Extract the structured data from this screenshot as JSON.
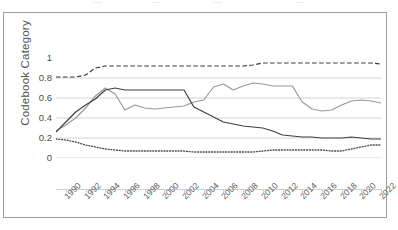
{
  "chart_data": {
    "type": "line",
    "title": "",
    "xlabel": "",
    "ylabel": "Codebook Category",
    "xlim": [
      1989,
      2022
    ],
    "ylim": [
      0,
      1
    ],
    "ytick_labels": [
      "1",
      "0.8",
      "0.6",
      "0.4",
      "0.2",
      "0"
    ],
    "ytick_values": [
      1,
      0.8,
      0.6,
      0.4,
      0.2,
      0
    ],
    "xtick_labels": [
      "1990",
      "1992",
      "1994",
      "1996",
      "1998",
      "2000",
      "2002",
      "2004",
      "2006",
      "2008",
      "2010",
      "2012",
      "2014",
      "2016",
      "2018",
      "2020",
      "2022"
    ],
    "xtick_values": [
      1990,
      1992,
      1994,
      1996,
      1998,
      2000,
      2002,
      2004,
      2006,
      2008,
      2010,
      2012,
      2014,
      2016,
      2018,
      2020,
      2022
    ],
    "grid": "horizontal",
    "legend_position": "top-cropped",
    "x": [
      1989,
      1990,
      1991,
      1992,
      1993,
      1994,
      1995,
      1996,
      1997,
      1998,
      1999,
      2000,
      2001,
      2002,
      2003,
      2004,
      2005,
      2006,
      2007,
      2008,
      2009,
      2010,
      2011,
      2012,
      2013,
      2014,
      2015,
      2016,
      2017,
      2018,
      2019,
      2020,
      2021,
      2022
    ],
    "series": [
      {
        "name": "series-dashed-upper",
        "style": "dashed",
        "color": "#3a3a3c",
        "values": [
          0.81,
          0.81,
          0.81,
          0.83,
          0.9,
          0.92,
          0.92,
          0.92,
          0.92,
          0.92,
          0.92,
          0.92,
          0.92,
          0.92,
          0.92,
          0.92,
          0.92,
          0.92,
          0.92,
          0.92,
          0.93,
          0.95,
          0.95,
          0.95,
          0.95,
          0.95,
          0.95,
          0.95,
          0.95,
          0.95,
          0.95,
          0.95,
          0.95,
          0.94
        ]
      },
      {
        "name": "series-solid-light",
        "style": "solid",
        "color": "#9a9a9d",
        "values": [
          0.27,
          0.33,
          0.4,
          0.5,
          0.62,
          0.7,
          0.64,
          0.48,
          0.53,
          0.5,
          0.49,
          0.5,
          0.51,
          0.52,
          0.56,
          0.58,
          0.71,
          0.74,
          0.68,
          0.72,
          0.75,
          0.74,
          0.72,
          0.72,
          0.72,
          0.56,
          0.49,
          0.47,
          0.48,
          0.53,
          0.57,
          0.58,
          0.57,
          0.55
        ]
      },
      {
        "name": "series-solid-dark",
        "style": "solid",
        "color": "#3f3f42",
        "values": [
          0.26,
          0.36,
          0.46,
          0.53,
          0.59,
          0.68,
          0.7,
          0.68,
          0.68,
          0.68,
          0.68,
          0.68,
          0.68,
          0.68,
          0.51,
          0.46,
          0.41,
          0.36,
          0.34,
          0.32,
          0.31,
          0.3,
          0.27,
          0.23,
          0.22,
          0.21,
          0.21,
          0.2,
          0.2,
          0.2,
          0.21,
          0.2,
          0.19,
          0.19
        ]
      },
      {
        "name": "series-dotted-lower",
        "style": "dotted",
        "color": "#4a4a4d",
        "values": [
          0.19,
          0.18,
          0.16,
          0.13,
          0.11,
          0.09,
          0.08,
          0.07,
          0.07,
          0.07,
          0.07,
          0.07,
          0.07,
          0.07,
          0.06,
          0.06,
          0.06,
          0.06,
          0.06,
          0.06,
          0.06,
          0.07,
          0.08,
          0.08,
          0.08,
          0.08,
          0.08,
          0.08,
          0.07,
          0.07,
          0.09,
          0.11,
          0.13,
          0.13
        ]
      }
    ],
    "series_tail": {
      "series-solid-dark": [
        0.19,
        0.18,
        0.16,
        0.14
      ],
      "series-dotted-lower": [
        0.13,
        0.12,
        0.11,
        0.1
      ]
    }
  },
  "legend": {
    "items": [
      {
        "label": ""
      },
      {
        "label": ""
      },
      {
        "label": ""
      },
      {
        "label": ""
      }
    ]
  },
  "axes": {
    "y_title": "Codebook Category"
  }
}
